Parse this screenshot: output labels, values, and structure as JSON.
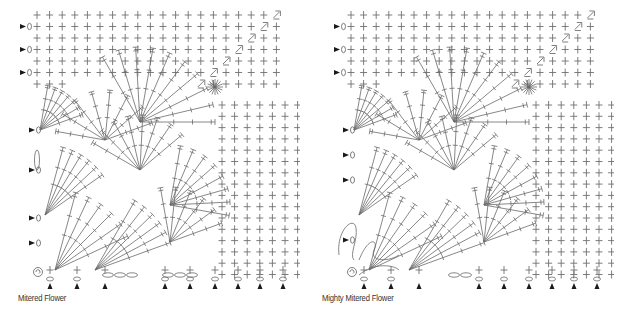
{
  "figures": [
    {
      "id": "left",
      "caption": "Mitered Flower",
      "grid": {
        "cols": 14,
        "rows": 7,
        "symbol": "single-crochet"
      },
      "start_markers_left": 9,
      "start_markers_bottom": 9
    },
    {
      "id": "right",
      "caption": "Mighty Mitered Flower",
      "grid": {
        "cols": 14,
        "rows": 7,
        "symbol": "single-crochet"
      },
      "start_markers_left": 8,
      "start_markers_bottom": 9
    }
  ],
  "colors": {
    "stitch": "#6f6f6f",
    "marker": "#1a1a1a",
    "caption": "#333333",
    "background": "#ffffff"
  }
}
